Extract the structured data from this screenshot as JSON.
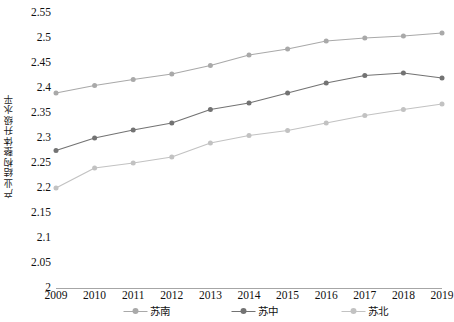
{
  "chart_data": {
    "type": "line",
    "title": "",
    "xlabel": "",
    "ylabel": "产业结构整体升级水平",
    "categories": [
      "2009",
      "2010",
      "2011",
      "2012",
      "2013",
      "2014",
      "2015",
      "2016",
      "2017",
      "2018",
      "2019"
    ],
    "x": [
      2009,
      2010,
      2011,
      2012,
      2013,
      2014,
      2015,
      2016,
      2017,
      2018,
      2019
    ],
    "ylim": [
      2,
      2.55
    ],
    "xlim": [
      2009,
      2019
    ],
    "ytick_labels": [
      "2",
      "2.05",
      "2.1",
      "2.15",
      "2.2",
      "2.25",
      "2.3",
      "2.35",
      "2.4",
      "2.45",
      "2.5",
      "2.55"
    ],
    "ytick_values": [
      2,
      2.05,
      2.1,
      2.15,
      2.2,
      2.25,
      2.3,
      2.35,
      2.4,
      2.45,
      2.5,
      2.55
    ],
    "ytick_step": 0.05,
    "grid": false,
    "legend_position": "bottom",
    "marker": "circle",
    "series": [
      {
        "name": "苏南",
        "color": "#a9a9a9",
        "values": [
          2.39,
          2.405,
          2.417,
          2.428,
          2.445,
          2.466,
          2.478,
          2.494,
          2.5,
          2.504,
          2.51
        ]
      },
      {
        "name": "苏中",
        "color": "#737373",
        "values": [
          2.275,
          2.3,
          2.316,
          2.33,
          2.357,
          2.37,
          2.39,
          2.41,
          2.425,
          2.43,
          2.42
        ]
      },
      {
        "name": "苏北",
        "color": "#c2c2c2",
        "values": [
          2.2,
          2.24,
          2.25,
          2.262,
          2.29,
          2.305,
          2.315,
          2.33,
          2.345,
          2.357,
          2.368
        ]
      }
    ]
  },
  "legend": {
    "items": [
      {
        "label": "苏南",
        "color": "#a9a9a9"
      },
      {
        "label": "苏中",
        "color": "#737373"
      },
      {
        "label": "苏北",
        "color": "#c2c2c2"
      }
    ]
  },
  "axis": {
    "y_title": "产业结构整体升级水平",
    "axis_line_color": "#a6a6a6"
  }
}
